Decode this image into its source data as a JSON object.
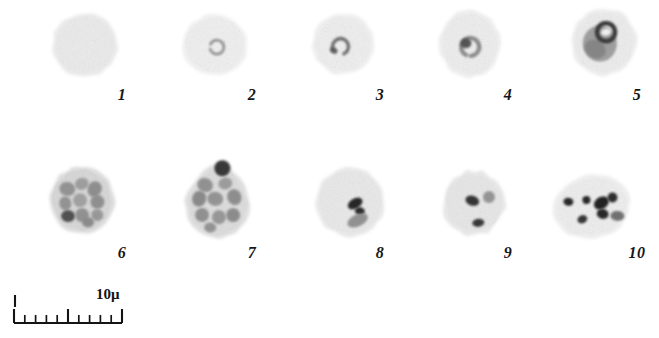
{
  "figure": {
    "kind": "microscopy-plate",
    "background_color": "#ffffff",
    "ink_color": "#171717",
    "width": 659,
    "height": 338,
    "rows": 2,
    "columns": 5
  },
  "scale": {
    "caption": "10μ",
    "unit": "μ",
    "length_value": "10",
    "bar_x": 14,
    "bar_y": 318,
    "bar_length_px": 108,
    "major_ticks": 3,
    "minor_ticks": 8,
    "tick_tall_px": 14,
    "tick_short_px": 8,
    "end_mark_label": "|"
  },
  "specimens": [
    {
      "label": "1",
      "label_x": 122,
      "label_y": 95,
      "cx": 85,
      "cy": 45,
      "rx": 29,
      "ry": 28,
      "rotate": -6,
      "body_fill": "#ededed",
      "edge_fill": "#e2e2e2",
      "shape": "round",
      "description": "uniform pale disc, no inclusions",
      "inclusions": []
    },
    {
      "label": "2",
      "label_x": 252,
      "label_y": 95,
      "cx": 215,
      "cy": 45,
      "rx": 29,
      "ry": 27,
      "rotate": 4,
      "body_fill": "#f2f2f2",
      "edge_fill": "#e9e9e9",
      "shape": "round",
      "description": "small ring form near centre",
      "inclusions": [
        {
          "type": "ring",
          "dx": 2,
          "dy": 2,
          "r": 7,
          "thickness": 2.6,
          "color": "#8f8f8f",
          "gap_deg": 40,
          "rotate": 200
        }
      ]
    },
    {
      "label": "3",
      "label_x": 380,
      "label_y": 95,
      "cx": 343,
      "cy": 44,
      "rx": 27,
      "ry": 27,
      "rotate": 10,
      "body_fill": "#f1f1f1",
      "edge_fill": "#e7e7e7",
      "shape": "round",
      "description": "broken ring / comma chromatin, slightly left of centre",
      "inclusions": [
        {
          "type": "ring",
          "dx": -2,
          "dy": 3,
          "r": 8,
          "thickness": 3.4,
          "color": "#6d6d6d",
          "gap_deg": 95,
          "rotate": 150
        },
        {
          "type": "blob",
          "dx": -8,
          "dy": 8,
          "rx": 4,
          "ry": 3,
          "color": "#5a5a5a",
          "rotate": 20
        }
      ]
    },
    {
      "label": "4",
      "label_x": 508,
      "label_y": 95,
      "cx": 470,
      "cy": 44,
      "rx": 27,
      "ry": 30,
      "rotate": -4,
      "body_fill": "#f0f0f0",
      "edge_fill": "#e6e6e6",
      "shape": "oval",
      "description": "thick ring with dark chromatin dot",
      "inclusions": [
        {
          "type": "ring",
          "dx": 0,
          "dy": 3,
          "r": 9,
          "thickness": 4.2,
          "color": "#8a8a8a",
          "gap_deg": 30,
          "rotate": 120
        },
        {
          "type": "blob",
          "dx": -4,
          "dy": -1,
          "rx": 5.5,
          "ry": 5,
          "color": "#4e4e4e",
          "rotate": 0
        }
      ]
    },
    {
      "label": "5",
      "label_x": 637,
      "label_y": 95,
      "cx": 604,
      "cy": 42,
      "rx": 29,
      "ry": 30,
      "rotate": 6,
      "body_fill": "#efefef",
      "edge_fill": "#e4e4e4",
      "shape": "round",
      "description": "large amoeboid trophozoite mass with dark vacuole ring at top",
      "inclusions": [
        {
          "type": "blob",
          "dx": -4,
          "dy": 2,
          "rx": 17,
          "ry": 18,
          "color": "#9a9a9a",
          "rotate": -10
        },
        {
          "type": "blob",
          "dx": -8,
          "dy": 8,
          "rx": 11,
          "ry": 9,
          "color": "#848484",
          "rotate": 25
        },
        {
          "type": "ring",
          "dx": 1,
          "dy": -10,
          "r": 9,
          "thickness": 4.5,
          "color": "#3a3a3a",
          "gap_deg": 0,
          "rotate": 0
        },
        {
          "type": "blob",
          "dx": 1,
          "dy": -10,
          "rx": 5,
          "ry": 3.5,
          "color": "#f4f4f4",
          "rotate": -15
        }
      ]
    },
    {
      "label": "6",
      "label_x": 122,
      "label_y": 253,
      "cx": 82,
      "cy": 200,
      "rx": 29,
      "ry": 30,
      "rotate": -8,
      "body_fill": "#d8d8d8",
      "edge_fill": "#cfcfcf",
      "shape": "round",
      "description": "mature schizont, many grey merozoites, one dark at lower left",
      "inclusions": [
        {
          "type": "blob",
          "dx": -13,
          "dy": -13,
          "rx": 8,
          "ry": 7,
          "color": "#8e8e8e",
          "rotate": 20
        },
        {
          "type": "blob",
          "dx": 2,
          "dy": -16,
          "rx": 7,
          "ry": 6,
          "color": "#9a9a9a",
          "rotate": -10
        },
        {
          "type": "blob",
          "dx": 14,
          "dy": -9,
          "rx": 7,
          "ry": 8,
          "color": "#8a8a8a",
          "rotate": 30
        },
        {
          "type": "blob",
          "dx": -17,
          "dy": 1,
          "rx": 6,
          "ry": 7,
          "color": "#8f8f8f",
          "rotate": 0
        },
        {
          "type": "blob",
          "dx": -2,
          "dy": 0,
          "rx": 7,
          "ry": 7,
          "color": "#9d9d9d",
          "rotate": 15
        },
        {
          "type": "blob",
          "dx": 15,
          "dy": 4,
          "rx": 7,
          "ry": 7,
          "color": "#8b8b8b",
          "rotate": -20
        },
        {
          "type": "blob",
          "dx": -16,
          "dy": 14,
          "rx": 7,
          "ry": 6,
          "color": "#4a4a4a",
          "rotate": 10
        },
        {
          "type": "blob",
          "dx": -2,
          "dy": 15,
          "rx": 7,
          "ry": 7,
          "color": "#8d8d8d",
          "rotate": -5
        },
        {
          "type": "blob",
          "dx": 13,
          "dy": 17,
          "rx": 6,
          "ry": 6,
          "color": "#949494",
          "rotate": 25
        },
        {
          "type": "blob",
          "dx": 3,
          "dy": 23,
          "rx": 6,
          "ry": 5,
          "color": "#878787",
          "rotate": 0
        }
      ]
    },
    {
      "label": "7",
      "label_x": 252,
      "label_y": 253,
      "cx": 218,
      "cy": 202,
      "rx": 29,
      "ry": 33,
      "rotate": 4,
      "body_fill": "#dedede",
      "edge_fill": "#d2d2d2",
      "shape": "teardrop",
      "description": "pear-shaped schizont with protruding dark blob at apex and many merozoites",
      "inclusions": [
        {
          "type": "blob",
          "dx": 2,
          "dy": -34,
          "rx": 8,
          "ry": 8,
          "color": "#2e2e2e",
          "rotate": 0
        },
        {
          "type": "blob",
          "dx": -14,
          "dy": -16,
          "rx": 8,
          "ry": 7,
          "color": "#8d8d8d",
          "rotate": 20
        },
        {
          "type": "blob",
          "dx": 6,
          "dy": -19,
          "rx": 7,
          "ry": 6,
          "color": "#989898",
          "rotate": -15
        },
        {
          "type": "blob",
          "dx": -19,
          "dy": -2,
          "rx": 7,
          "ry": 8,
          "color": "#858585",
          "rotate": 10
        },
        {
          "type": "blob",
          "dx": -3,
          "dy": -3,
          "rx": 8,
          "ry": 7,
          "color": "#8f8f8f",
          "rotate": 5
        },
        {
          "type": "blob",
          "dx": 16,
          "dy": -6,
          "rx": 7,
          "ry": 8,
          "color": "#898989",
          "rotate": -25
        },
        {
          "type": "blob",
          "dx": -15,
          "dy": 14,
          "rx": 7,
          "ry": 7,
          "color": "#8c8c8c",
          "rotate": 0
        },
        {
          "type": "blob",
          "dx": 2,
          "dy": 15,
          "rx": 7,
          "ry": 7,
          "color": "#939393",
          "rotate": 15
        },
        {
          "type": "blob",
          "dx": 16,
          "dy": 12,
          "rx": 7,
          "ry": 7,
          "color": "#878787",
          "rotate": -10
        },
        {
          "type": "blob",
          "dx": -6,
          "dy": 26,
          "rx": 6,
          "ry": 5,
          "color": "#8f8f8f",
          "rotate": 0
        }
      ]
    },
    {
      "label": "8",
      "label_x": 380,
      "label_y": 253,
      "cx": 350,
      "cy": 202,
      "rx": 31,
      "ry": 31,
      "rotate": -5,
      "body_fill": "#ebebeb",
      "edge_fill": "#e0e0e0",
      "shape": "round",
      "description": "pale cell with dark angular pigment clump and grey crescent below",
      "inclusions": [
        {
          "type": "blob",
          "dx": 5,
          "dy": 2,
          "rx": 8,
          "ry": 5,
          "color": "#1f1f1f",
          "rotate": -25
        },
        {
          "type": "blob",
          "dx": 9,
          "dy": 10,
          "rx": 5,
          "ry": 4,
          "color": "#242424",
          "rotate": 15
        },
        {
          "type": "blob",
          "dx": 6,
          "dy": 19,
          "rx": 11,
          "ry": 6,
          "color": "#8c8c8c",
          "rotate": -20
        }
      ]
    },
    {
      "label": "9",
      "label_x": 508,
      "label_y": 253,
      "cx": 474,
      "cy": 203,
      "rx": 27,
      "ry": 29,
      "rotate": 8,
      "body_fill": "#e9e9e9",
      "edge_fill": "#dedede",
      "shape": "angular",
      "description": "pale cell with small dark pigment cluster at centre and dark mark lower right",
      "inclusions": [
        {
          "type": "blob",
          "dx": -2,
          "dy": -2,
          "rx": 7,
          "ry": 5,
          "color": "#2a2a2a",
          "rotate": 10
        },
        {
          "type": "blob",
          "dx": 14,
          "dy": -8,
          "rx": 6,
          "ry": 6,
          "color": "#8f8f8f",
          "rotate": 0
        },
        {
          "type": "blob",
          "dx": 7,
          "dy": 19,
          "rx": 6,
          "ry": 4,
          "color": "#2f2f2f",
          "rotate": -15
        }
      ]
    },
    {
      "label": "10",
      "label_x": 637,
      "label_y": 253,
      "cx": 592,
      "cy": 207,
      "rx": 35,
      "ry": 28,
      "rotate": -12,
      "body_fill": "#f0f0f0",
      "edge_fill": "#e6e6e6",
      "shape": "oval",
      "description": "pale ovoid cell with several discrete black pigment granules",
      "inclusions": [
        {
          "type": "blob",
          "dx": -22,
          "dy": -10,
          "rx": 5,
          "ry": 4,
          "color": "#1a1a1a",
          "rotate": 20
        },
        {
          "type": "blob",
          "dx": -4,
          "dy": -8,
          "rx": 4,
          "ry": 4,
          "color": "#1c1c1c",
          "rotate": 0
        },
        {
          "type": "blob",
          "dx": 10,
          "dy": -2,
          "rx": 8,
          "ry": 6,
          "color": "#151515",
          "rotate": -20
        },
        {
          "type": "blob",
          "dx": 22,
          "dy": -5,
          "rx": 5,
          "ry": 5,
          "color": "#222222",
          "rotate": 10
        },
        {
          "type": "blob",
          "dx": 9,
          "dy": 9,
          "rx": 6,
          "ry": 5,
          "color": "#1e1e1e",
          "rotate": 25
        },
        {
          "type": "blob",
          "dx": -12,
          "dy": 10,
          "rx": 5,
          "ry": 4,
          "color": "#2a2a2a",
          "rotate": -10
        },
        {
          "type": "blob",
          "dx": 23,
          "dy": 14,
          "rx": 7,
          "ry": 5,
          "color": "#6a6a6a",
          "rotate": 15
        }
      ]
    }
  ]
}
